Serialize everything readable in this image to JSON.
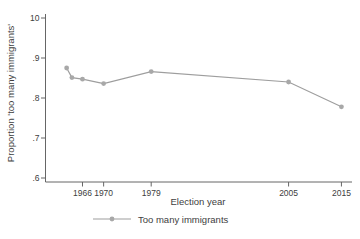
{
  "figure": {
    "background": "#ffffff"
  },
  "chart_data": {
    "type": "line",
    "title": "",
    "xlabel": "Election year",
    "ylabel": "Proportion 'too many immigrants'",
    "x": [
      1963,
      1964,
      1966,
      1970,
      1979,
      2005,
      2015
    ],
    "series": [
      {
        "name": "Too many immigrants",
        "values": [
          0.875,
          0.851,
          0.847,
          0.836,
          0.866,
          0.84,
          0.778
        ]
      }
    ],
    "xlim": [
      1959,
      2017
    ],
    "ylim": [
      0.6,
      1.0
    ],
    "xticks": {
      "values": [
        1966,
        1970,
        1979,
        2005,
        2015
      ],
      "labels": [
        "1966",
        "1970",
        "1979",
        "2005",
        "2015"
      ]
    },
    "yticks": {
      "values": [
        1.0,
        0.9,
        0.8,
        0.7,
        0.6
      ],
      "labels": [
        "10",
        ".9",
        ".8",
        ".7",
        ".6"
      ]
    },
    "grid": false,
    "legend_position": "bottom-center",
    "colors": {
      "line": "#9e9e9e",
      "marker": "#a8a8a8",
      "axis": "#666666",
      "tick_text": "#404040"
    }
  }
}
